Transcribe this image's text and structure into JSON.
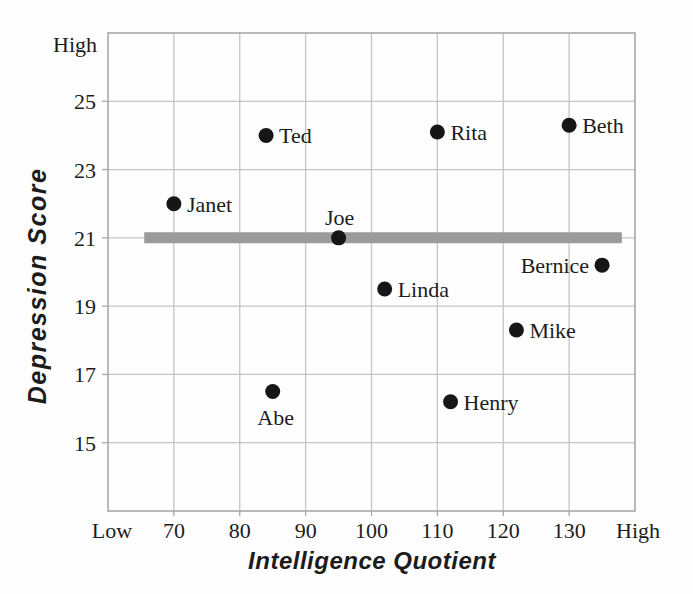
{
  "chart_data": {
    "type": "scatter",
    "title": "",
    "xlabel": "Intelligence Quotient",
    "ylabel": "Depression Score",
    "x_axis": {
      "min": 60,
      "max": 140,
      "ticks": [
        70,
        80,
        90,
        100,
        110,
        120,
        130
      ],
      "min_label": "Low",
      "max_label": "High"
    },
    "y_axis": {
      "min": 13,
      "max": 27,
      "ticks": [
        15,
        17,
        19,
        21,
        23,
        25
      ],
      "max_label": "High"
    },
    "grid": true,
    "legend": "none",
    "points": [
      {
        "name": "Janet",
        "x": 70,
        "y": 22.0,
        "label_side": "right"
      },
      {
        "name": "Ted",
        "x": 84,
        "y": 24.0,
        "label_side": "right"
      },
      {
        "name": "Joe",
        "x": 95,
        "y": 21.0,
        "label_side": "above"
      },
      {
        "name": "Abe",
        "x": 85,
        "y": 16.5,
        "label_side": "below"
      },
      {
        "name": "Linda",
        "x": 102,
        "y": 19.5,
        "label_side": "right"
      },
      {
        "name": "Rita",
        "x": 110,
        "y": 24.1,
        "label_side": "right"
      },
      {
        "name": "Henry",
        "x": 112,
        "y": 16.2,
        "label_side": "right"
      },
      {
        "name": "Mike",
        "x": 122,
        "y": 18.3,
        "label_side": "right"
      },
      {
        "name": "Beth",
        "x": 130,
        "y": 24.3,
        "label_side": "right"
      },
      {
        "name": "Bernice",
        "x": 135,
        "y": 20.2,
        "label_side": "left"
      }
    ],
    "mean_line": {
      "y": 21,
      "x_start": 65.5,
      "x_end": 138,
      "color": "#9b9b9b",
      "thickness": 11
    },
    "colors": {
      "point": "#161616",
      "text": "#1c1c1c",
      "gridline": "#c4c4c4",
      "border": "#a8a8a8",
      "background": "#fefefe"
    }
  }
}
